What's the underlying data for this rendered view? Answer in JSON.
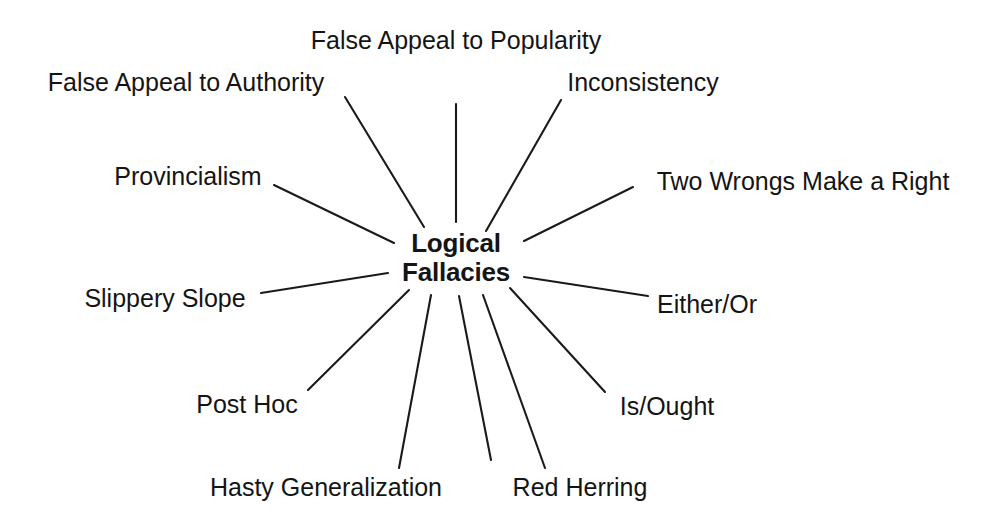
{
  "diagram": {
    "type": "radial-spoke-diagram",
    "background_color": "#ffffff",
    "line_color": "#1a1a1a",
    "text_color": "#141414",
    "hub": {
      "line1": "Logical",
      "line2": "Fallacies",
      "center_x": 456,
      "center_y": 258
    },
    "nodes": [
      {
        "label": "False Appeal to Popularity",
        "x": 456,
        "y": 40,
        "align": "center",
        "font_size": 25,
        "spoke": {
          "x1": 456,
          "y1": 104,
          "x2": 456,
          "y2": 222
        }
      },
      {
        "label": "False Appeal to Authority",
        "x": 186,
        "y": 82,
        "align": "center",
        "font_size": 25,
        "spoke": {
          "x1": 345,
          "y1": 97,
          "x2": 424,
          "y2": 227
        }
      },
      {
        "label": "Inconsistency",
        "x": 643,
        "y": 82,
        "align": "center",
        "font_size": 25,
        "spoke": {
          "x1": 561,
          "y1": 100,
          "x2": 486,
          "y2": 231
        }
      },
      {
        "label": "Provincialism",
        "x": 188,
        "y": 176,
        "align": "center",
        "font_size": 25,
        "spoke": {
          "x1": 274,
          "y1": 185,
          "x2": 394,
          "y2": 243
        }
      },
      {
        "label": "Two Wrongs Make a Right",
        "x": 803,
        "y": 181,
        "align": "center",
        "font_size": 25,
        "spoke": {
          "x1": 633,
          "y1": 187,
          "x2": 524,
          "y2": 241
        }
      },
      {
        "label": "Slippery Slope",
        "x": 165,
        "y": 298,
        "align": "center",
        "font_size": 25,
        "spoke": {
          "x1": 261,
          "y1": 293,
          "x2": 388,
          "y2": 273
        }
      },
      {
        "label": "Either/Or",
        "x": 707,
        "y": 304,
        "align": "center",
        "font_size": 25,
        "spoke": {
          "x1": 648,
          "y1": 296,
          "x2": 524,
          "y2": 277
        }
      },
      {
        "label": "Post Hoc",
        "x": 247,
        "y": 404,
        "align": "center",
        "font_size": 25,
        "spoke": {
          "x1": 308,
          "y1": 390,
          "x2": 409,
          "y2": 290
        }
      },
      {
        "label": "Is/Ought",
        "x": 667,
        "y": 406,
        "align": "center",
        "font_size": 25,
        "spoke": {
          "x1": 605,
          "y1": 392,
          "x2": 510,
          "y2": 288
        }
      },
      {
        "label": "Hasty Generalization",
        "x": 326,
        "y": 487,
        "align": "center",
        "font_size": 25,
        "spoke": {
          "x1": 399,
          "y1": 468,
          "x2": 431,
          "y2": 295
        }
      },
      {
        "label": "Red Herring",
        "x": 580,
        "y": 487,
        "align": "center",
        "font_size": 25,
        "spoke": {
          "x1": 545,
          "y1": 468,
          "x2": 483,
          "y2": 295
        }
      },
      {
        "label": "",
        "x": 0,
        "y": 0,
        "align": "center",
        "font_size": 25,
        "spoke": {
          "x1": 491,
          "y1": 460,
          "x2": 459,
          "y2": 296
        }
      }
    ]
  }
}
